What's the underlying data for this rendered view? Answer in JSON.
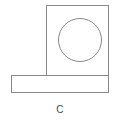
{
  "figure": {
    "label": "C",
    "caption_label": "C",
    "background_color": "#ffffff",
    "line_color": "#8a8a8a",
    "fill_color": "#ffffff",
    "label_color": "#4a4a4a",
    "line_width": 1,
    "view_box": "0 0 120 130"
  },
  "shapes": {
    "upright_plate": {
      "name": "upright square plate",
      "x": 46,
      "y": 5,
      "width": 63,
      "height": 71
    },
    "base_plate": {
      "name": "horizontal base plate",
      "x": 11,
      "y": 75,
      "width": 98,
      "height": 18
    },
    "hole": {
      "name": "circular through hole",
      "cx": 80,
      "cy": 40,
      "r": 21.5
    }
  },
  "label_position": {
    "x": 60,
    "y": 112
  }
}
